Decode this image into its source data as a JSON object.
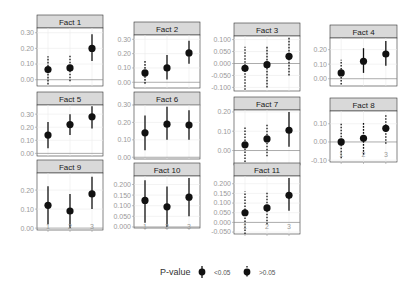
{
  "chart_data": {
    "type": "scatter",
    "subtype": "faceted point-range (coefficient plot)",
    "x_categories": [
      "1",
      "2",
      "3"
    ],
    "legend": {
      "title": "P-value",
      "position": "bottom",
      "entries": [
        {
          "label": "<0.05",
          "line_style": "solid"
        },
        {
          "label": ">0.05",
          "line_style": "dotted"
        }
      ]
    },
    "facets": [
      {
        "title": "Fact 1",
        "yticks": [
          "0.00",
          "0.10",
          "0.20",
          "0.30"
        ],
        "ylim": [
          -0.04,
          0.33
        ],
        "points": [
          {
            "x": 1,
            "y": 0.065,
            "lo": -0.03,
            "hi": 0.15,
            "sig": false
          },
          {
            "x": 2,
            "y": 0.075,
            "lo": -0.01,
            "hi": 0.16,
            "sig": false
          },
          {
            "x": 3,
            "y": 0.2,
            "lo": 0.12,
            "hi": 0.29,
            "sig": true
          }
        ]
      },
      {
        "title": "Fact 2",
        "yticks": [
          "0.00",
          "0.10",
          "0.20",
          "0.30"
        ],
        "ylim": [
          -0.04,
          0.33
        ],
        "points": [
          {
            "x": 1,
            "y": 0.065,
            "lo": -0.01,
            "hi": 0.15,
            "sig": false
          },
          {
            "x": 2,
            "y": 0.1,
            "lo": 0.02,
            "hi": 0.19,
            "sig": true
          },
          {
            "x": 3,
            "y": 0.205,
            "lo": 0.13,
            "hi": 0.29,
            "sig": true
          }
        ]
      },
      {
        "title": "Fact 3",
        "yticks": [
          "0.100",
          "0.050",
          "0.000",
          "-0.050",
          "-0.100"
        ],
        "ylim": [
          -0.115,
          0.115
        ],
        "points": [
          {
            "x": 1,
            "y": -0.02,
            "lo": -0.11,
            "hi": 0.07,
            "sig": false
          },
          {
            "x": 2,
            "y": -0.005,
            "lo": -0.1,
            "hi": 0.075,
            "sig": false
          },
          {
            "x": 3,
            "y": 0.03,
            "lo": -0.05,
            "hi": 0.11,
            "sig": false
          }
        ]
      },
      {
        "title": "Fact 4",
        "yticks": [
          "0.00",
          "0.10",
          "0.20"
        ],
        "ylim": [
          -0.05,
          0.28
        ],
        "points": [
          {
            "x": 1,
            "y": 0.04,
            "lo": -0.04,
            "hi": 0.13,
            "sig": false
          },
          {
            "x": 2,
            "y": 0.12,
            "lo": 0.04,
            "hi": 0.21,
            "sig": true
          },
          {
            "x": 3,
            "y": 0.17,
            "lo": 0.09,
            "hi": 0.26,
            "sig": true
          }
        ]
      },
      {
        "title": "Fact 5",
        "yticks": [
          "0.00",
          "0.10",
          "0.20",
          "0.30"
        ],
        "ylim": [
          -0.02,
          0.37
        ],
        "points": [
          {
            "x": 1,
            "y": 0.14,
            "lo": 0.04,
            "hi": 0.24,
            "sig": true
          },
          {
            "x": 2,
            "y": 0.22,
            "lo": 0.14,
            "hi": 0.3,
            "sig": true
          },
          {
            "x": 3,
            "y": 0.28,
            "lo": 0.19,
            "hi": 0.36,
            "sig": true
          }
        ]
      },
      {
        "title": "Fact 6",
        "yticks": [
          "0.00",
          "0.10",
          "0.20",
          "0.30"
        ],
        "ylim": [
          -0.01,
          0.3
        ],
        "points": [
          {
            "x": 1,
            "y": 0.14,
            "lo": 0.04,
            "hi": 0.24,
            "sig": true
          },
          {
            "x": 2,
            "y": 0.19,
            "lo": 0.1,
            "hi": 0.29,
            "sig": true
          },
          {
            "x": 3,
            "y": 0.185,
            "lo": 0.1,
            "hi": 0.27,
            "sig": true
          }
        ]
      },
      {
        "title": "Fact 7",
        "yticks": [
          "0.00",
          "0.10",
          "0.20"
        ],
        "ylim": [
          -0.075,
          0.21
        ],
        "points": [
          {
            "x": 1,
            "y": 0.03,
            "lo": -0.06,
            "hi": 0.12,
            "sig": false
          },
          {
            "x": 2,
            "y": 0.06,
            "lo": -0.03,
            "hi": 0.14,
            "sig": false
          },
          {
            "x": 3,
            "y": 0.105,
            "lo": 0.02,
            "hi": 0.2,
            "sig": true
          }
        ]
      },
      {
        "title": "Fact 8",
        "yticks": [
          "0.10",
          "0.00",
          "-0.10"
        ],
        "ylim": [
          -0.11,
          0.17
        ],
        "points": [
          {
            "x": 1,
            "y": 0.0,
            "lo": -0.09,
            "hi": 0.1,
            "sig": false
          },
          {
            "x": 2,
            "y": 0.02,
            "lo": -0.07,
            "hi": 0.11,
            "sig": false
          },
          {
            "x": 3,
            "y": 0.075,
            "lo": -0.01,
            "hi": 0.15,
            "sig": false
          }
        ]
      },
      {
        "title": "Fact 9",
        "yticks": [
          "0.00",
          "0.10",
          "0.20"
        ],
        "ylim": [
          -0.01,
          0.29
        ],
        "points": [
          {
            "x": 1,
            "y": 0.12,
            "lo": 0.02,
            "hi": 0.22,
            "sig": true
          },
          {
            "x": 2,
            "y": 0.09,
            "lo": 0.0,
            "hi": 0.18,
            "sig": true
          },
          {
            "x": 3,
            "y": 0.18,
            "lo": 0.1,
            "hi": 0.27,
            "sig": true
          }
        ]
      },
      {
        "title": "Fact 10",
        "yticks": [
          "0.200",
          "0.150",
          "0.100",
          "0.050",
          "0.000"
        ],
        "ylim": [
          -0.005,
          0.24
        ],
        "points": [
          {
            "x": 1,
            "y": 0.125,
            "lo": 0.02,
            "hi": 0.22,
            "sig": true
          },
          {
            "x": 2,
            "y": 0.095,
            "lo": 0.0,
            "hi": 0.19,
            "sig": true
          },
          {
            "x": 3,
            "y": 0.14,
            "lo": 0.05,
            "hi": 0.23,
            "sig": true
          }
        ]
      },
      {
        "title": "Fact 11",
        "yticks": [
          "0.200",
          "0.150",
          "0.100",
          "0.050",
          "0.000",
          "-0.050"
        ],
        "ylim": [
          -0.06,
          0.24
        ],
        "points": [
          {
            "x": 1,
            "y": 0.05,
            "lo": -0.06,
            "hi": 0.16,
            "sig": false
          },
          {
            "x": 2,
            "y": 0.075,
            "lo": -0.01,
            "hi": 0.16,
            "sig": false
          },
          {
            "x": 3,
            "y": 0.14,
            "lo": 0.06,
            "hi": 0.23,
            "sig": true
          }
        ]
      }
    ]
  },
  "layout": {
    "panels": [
      {
        "x": 37,
        "y": 15,
        "w": 66,
        "strip": 13,
        "h": 58
      },
      {
        "x": 134,
        "y": 22,
        "w": 66,
        "strip": 13,
        "h": 53
      },
      {
        "x": 234,
        "y": 23,
        "w": 66,
        "strip": 13,
        "h": 55
      },
      {
        "x": 330,
        "y": 25,
        "w": 67,
        "strip": 13,
        "h": 48
      },
      {
        "x": 37,
        "y": 92,
        "w": 66,
        "strip": 13,
        "h": 51
      },
      {
        "x": 134,
        "y": 92,
        "w": 66,
        "strip": 13,
        "h": 54
      },
      {
        "x": 234,
        "y": 97,
        "w": 66,
        "strip": 13,
        "h": 55
      },
      {
        "x": 330,
        "y": 98,
        "w": 67,
        "strip": 13,
        "h": 51
      },
      {
        "x": 37,
        "y": 160,
        "w": 66,
        "strip": 13,
        "h": 57
      },
      {
        "x": 134,
        "y": 163,
        "w": 66,
        "strip": 13,
        "h": 52
      },
      {
        "x": 234,
        "y": 163,
        "w": 66,
        "strip": 13,
        "h": 58
      }
    ],
    "xtick_rows": [
      {
        "panels": [
          7
        ],
        "y": 157
      },
      {
        "panels": [
          8,
          9,
          10
        ],
        "y": 229
      }
    ],
    "legend": {
      "x": 160,
      "y": 272
    }
  }
}
